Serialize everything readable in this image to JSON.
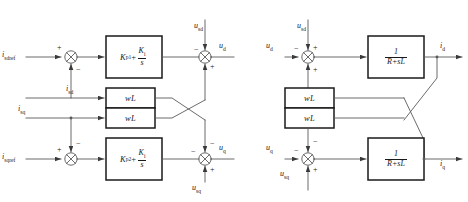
{
  "diagram": {
    "left_section": {
      "name": "controller",
      "inputs": [
        {
          "id": "isdref",
          "label": "i",
          "sub": "sdref"
        },
        {
          "id": "isd",
          "label": "i",
          "sub": "sd"
        },
        {
          "id": "isq",
          "label": "i",
          "sub": "sq"
        },
        {
          "id": "isqref",
          "label": "i",
          "sub": "sqref"
        }
      ],
      "disturbances": [
        {
          "id": "usd",
          "label": "u",
          "sub": "sd"
        },
        {
          "id": "usq",
          "label": "u",
          "sub": "sq"
        }
      ],
      "outputs": [
        {
          "id": "ud",
          "label": "u",
          "sub": "d"
        },
        {
          "id": "uq",
          "label": "u",
          "sub": "q"
        }
      ],
      "blocks": [
        {
          "id": "pi1",
          "kind": "pi-controller",
          "kp": "K",
          "kp_sub": "p1",
          "num": "K",
          "num_sub": "i",
          "den": "s"
        },
        {
          "id": "wl1",
          "kind": "decoupling",
          "text": "wL"
        },
        {
          "id": "wl2",
          "kind": "decoupling",
          "text": "wL"
        },
        {
          "id": "pi2",
          "kind": "pi-controller",
          "kp": "K",
          "kp_sub": "p2",
          "num": "K",
          "num_sub": "i",
          "den": "s"
        }
      ],
      "signs": {
        "sum1_in": "+",
        "sum1_fb": "−",
        "sum2_in": "+",
        "sum2_fb": "−",
        "sum3_top": "−",
        "sum3_bot": "+",
        "sum4_top": "−",
        "sum4_left": "−",
        "sum4_bot": "+"
      }
    },
    "right_section": {
      "name": "plant",
      "inputs": [
        {
          "id": "ud",
          "label": "u",
          "sub": "d"
        },
        {
          "id": "uq",
          "label": "u",
          "sub": "q"
        }
      ],
      "disturbances": [
        {
          "id": "usd",
          "label": "u",
          "sub": "sd"
        },
        {
          "id": "usq",
          "label": "u",
          "sub": "sq"
        }
      ],
      "outputs": [
        {
          "id": "id",
          "label": "i",
          "sub": "d"
        },
        {
          "id": "iq",
          "label": "i",
          "sub": "q"
        }
      ],
      "blocks": [
        {
          "id": "plant1",
          "kind": "transfer-function",
          "num": "1",
          "den": "R+sL"
        },
        {
          "id": "wl3",
          "kind": "decoupling",
          "text": "wL"
        },
        {
          "id": "wl4",
          "kind": "decoupling",
          "text": "wL"
        },
        {
          "id": "plant2",
          "kind": "transfer-function",
          "num": "1",
          "den": "R+sL"
        }
      ],
      "signs": {
        "sum5_left": "−",
        "sum5_top": "+",
        "sum5_bot": "+",
        "sum6_left": "−",
        "sum6_top": "−",
        "sum6_bot": "+"
      }
    },
    "colors": {
      "line": "#4a4a4a",
      "block_border": "#1a1a1a",
      "text": "#1a1a1a",
      "background": "#ffffff"
    }
  }
}
